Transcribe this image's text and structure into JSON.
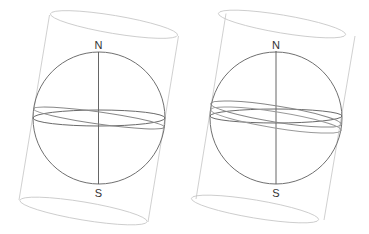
{
  "figures": [
    {
      "id": "left",
      "north_label": "N",
      "south_label": "S",
      "center": [
        99,
        118
      ],
      "radius": 66
    },
    {
      "id": "right",
      "north_label": "N",
      "south_label": "S",
      "center": [
        276,
        118
      ],
      "radius": 66
    }
  ],
  "colors": {
    "cylinder": "#c4c4c4",
    "sphere": "#707070",
    "equator": "#6a6a6a",
    "tilted_orbit": "#888888",
    "axis": "#555555"
  }
}
